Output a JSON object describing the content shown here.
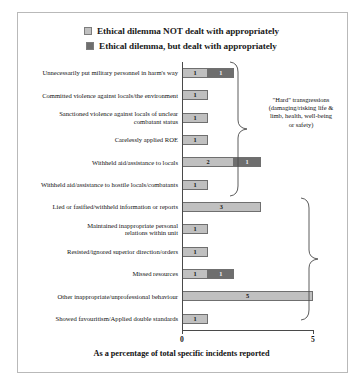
{
  "chart_data": {
    "type": "bar",
    "orientation": "horizontal",
    "stacked": true,
    "title": "",
    "xlabel": "As a percentage of total specific incidents reported",
    "ylabel": "",
    "xlim": [
      0,
      5
    ],
    "xticks": [
      0,
      5
    ],
    "xtick_labels": [
      "0",
      "5"
    ],
    "grid": false,
    "legend_position": "top",
    "categories": [
      "Unnecessarily put military personnel in harm's way",
      "Committed violence against locals/the environment",
      "Sanctioned violence against locals of unclear\ncombatant status",
      "Carelessly applied ROE",
      "Withheld aid/assistance to locals",
      "Withheld aid/assistance to hostile locals/combatants",
      "Lied or fasified/withheld information or reports",
      "Maintained inappropriate personal\nrelations within unit",
      "Resisted/ignored superior direction/orders",
      "Missed resources",
      "Other inappropriate/unprofessional behaviour",
      "Showed favouritism/Applied double standards"
    ],
    "series": [
      {
        "name": "Ethical dilemma NOT dealt with appropriately",
        "color": "#c0c0c0",
        "values": [
          1,
          1,
          1,
          1,
          2,
          1,
          3,
          1,
          1,
          1,
          5,
          1
        ]
      },
      {
        "name": "Ethical dilemma, but dealt with appropriately",
        "color": "#6e6e6e",
        "values": [
          1,
          0,
          0,
          0,
          1,
          0,
          0,
          0,
          0,
          1,
          0,
          0
        ]
      }
    ],
    "annotations": [
      {
        "text": "\"Hard\" transgressions\n(damaging/risking life &\nlimb, health, well-being\nor safety)",
        "group_start": 0,
        "group_end": 5
      },
      {
        "text": "",
        "group_start": 6,
        "group_end": 11
      }
    ]
  },
  "legend": {
    "items": [
      {
        "label": "Ethical dilemma NOT dealt with appropriately",
        "color": "#c0c0c0"
      },
      {
        "label": "Ethical dilemma, but dealt with appropriately",
        "color": "#6e6e6e"
      }
    ]
  },
  "axis": {
    "x_title": "As a percentage of total specific incidents reported",
    "tick_min": "0",
    "tick_max": "5"
  }
}
